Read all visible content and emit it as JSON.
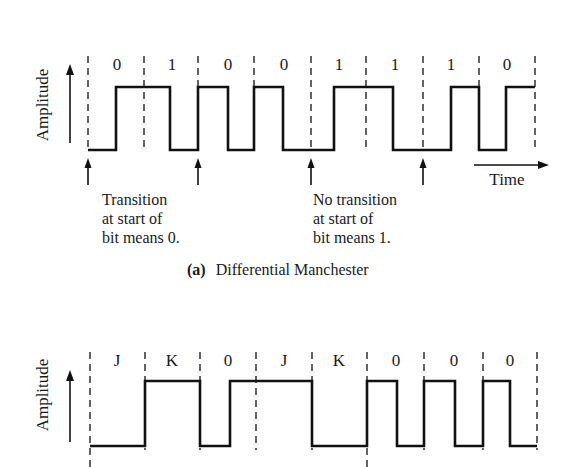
{
  "top_diagram": {
    "ylabel": "Amplitude",
    "bits": [
      "0",
      "1",
      "0",
      "0",
      "1",
      "1",
      "1",
      "0"
    ],
    "time_label": "Time",
    "annotation_left": [
      "Transition",
      "at start of",
      "bit means 0."
    ],
    "annotation_right": [
      "No transition",
      "at start of",
      "bit means 1."
    ],
    "caption_letter": "(a)",
    "caption_text": "Differential Manchester"
  },
  "bottom_diagram": {
    "ylabel": "Amplitude",
    "symbols": [
      "J",
      "K",
      "0",
      "J",
      "K",
      "0",
      "0",
      "0"
    ]
  },
  "colors": {
    "line": "#111111",
    "background": "#ffffff"
  }
}
